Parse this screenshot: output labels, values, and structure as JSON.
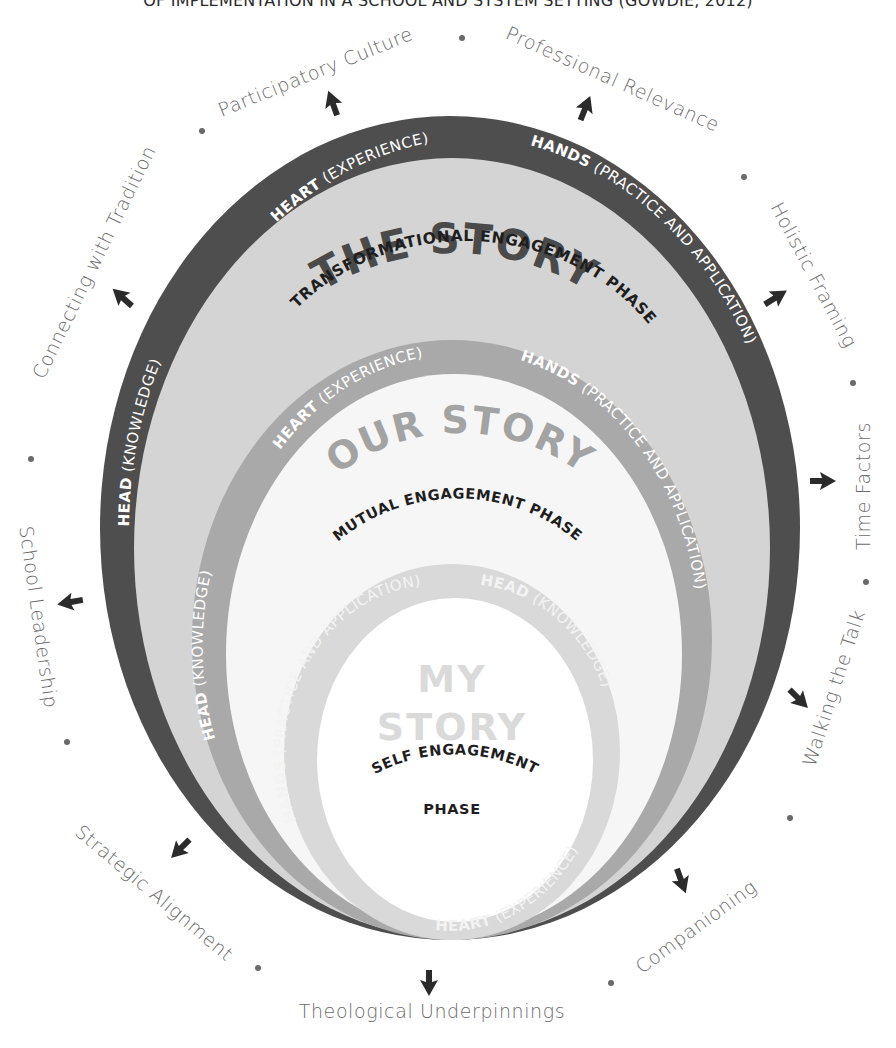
{
  "title": "OF IMPLEMENTATION IN A SCHOOL AND SYSTEM SETTING (GOWDIE, 2012)",
  "colors": {
    "outer_ring": "#4e4e4e",
    "outer_fill": "#d4d4d4",
    "middle_ring": "#a9a9a9",
    "middle_fill": "#f6f6f6",
    "inner_ring": "#d9d9d9",
    "inner_fill": "#ffffff",
    "label_text": "#6a6a6a",
    "arrow": "#2b2b2b"
  },
  "rings": {
    "outer": {
      "title": "THE STORY",
      "phase": "TRANSFORMATIONAL ENGAGEMENT PHASE",
      "head_bold": "HEAD",
      "head_rest": " (KNOWLEDGE)",
      "heart_bold": "HEART",
      "heart_rest": " (EXPERIENCE)",
      "hands_bold": "HANDS",
      "hands_rest": " (PRACTICE AND APPLICATION)"
    },
    "middle": {
      "title": "OUR STORY",
      "phase": "MUTUAL ENGAGEMENT PHASE",
      "head_bold": "HEAD",
      "head_rest": " (KNOWLEDGE)",
      "heart_bold": "HEART",
      "heart_rest": " (EXPERIENCE)",
      "hands_bold": "HANDS",
      "hands_rest": " (PRACTICE AND APPLICATION)"
    },
    "inner": {
      "title_line1": "MY",
      "title_line2": "STORY",
      "phase_line1": "SELF ENGAGEMENT",
      "phase_line2": "PHASE",
      "head_bold": "HEAD",
      "head_rest": " (KNOWLEDGE)",
      "heart_bold": "HEART",
      "heart_rest": " (EXPERIENCE)",
      "hands_bold": "HANDS",
      "hands_rest": " (PRACTICE AND APPLICATION)"
    }
  },
  "outer_labels": [
    "Participatory Culture",
    "Professional Relevance",
    "Holistic Framing",
    "Time Factors",
    "Walking the Talk",
    "Companioning",
    "Theological Underpinnings",
    "Strategic Alignment",
    "School Leadership",
    "Connecting with Tradition"
  ]
}
